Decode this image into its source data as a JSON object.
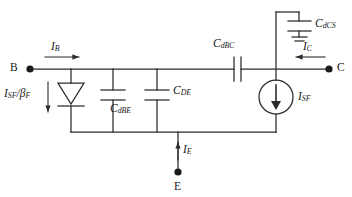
{
  "diagram": {
    "stroke_color": "#2b2b2b",
    "text_color": "#1a1a1a",
    "background": "#ffffff"
  },
  "terminals": [
    {
      "id": "base",
      "label": "B"
    },
    {
      "id": "collector",
      "label": "C"
    },
    {
      "id": "emitter",
      "label": "E"
    }
  ],
  "currents": [
    {
      "id": "base-current",
      "symbol": "I",
      "subscript": "B",
      "direction": "right"
    },
    {
      "id": "collector-current",
      "symbol": "I",
      "subscript": "C",
      "direction": "left"
    },
    {
      "id": "emitter-current",
      "symbol": "I",
      "subscript": "E",
      "direction": "up"
    },
    {
      "id": "diode-current",
      "symbol": "I",
      "subscript": "SF",
      "denominator_symbol": "β",
      "denominator_subscript": "F",
      "direction": "down"
    },
    {
      "id": "source-current",
      "symbol": "I",
      "subscript": "SF",
      "direction": "down"
    }
  ],
  "components": [
    {
      "id": "diode-base-emitter",
      "type": "diode",
      "label_symbol": "I",
      "label_subscript": "SF",
      "label_divider": "/",
      "label_denominator": "β",
      "label_denominator_subscript": "F"
    },
    {
      "id": "cap-dbe",
      "type": "capacitor",
      "symbol": "C",
      "subscript": "dBE"
    },
    {
      "id": "cap-de",
      "type": "capacitor",
      "symbol": "C",
      "subscript": "DE"
    },
    {
      "id": "cap-dbc",
      "type": "capacitor",
      "symbol": "C",
      "subscript": "dBC"
    },
    {
      "id": "cap-dcs",
      "type": "capacitor",
      "symbol": "C",
      "subscript": "dCS"
    },
    {
      "id": "current-source-sf",
      "type": "current-source",
      "symbol": "I",
      "subscript": "SF"
    },
    {
      "id": "ground-substrate",
      "type": "ground"
    }
  ],
  "labels": {
    "terminal_b": "B",
    "terminal_c": "C",
    "terminal_e": "E",
    "i_b_sym": "I",
    "i_b_sub": "B",
    "i_c_sym": "I",
    "i_c_sub": "C",
    "i_e_sym": "I",
    "i_e_sub": "E",
    "i_sf_beta_f_num_sym": "I",
    "i_sf_beta_f_num_sub": "SF",
    "i_sf_beta_f_slash": "/",
    "i_sf_beta_f_den_sym": "β",
    "i_sf_beta_f_den_sub": "F",
    "c_dbe_sym": "C",
    "c_dbe_sub": "dBE",
    "c_de_sym": "C",
    "c_de_sub": "DE",
    "c_dbc_sym": "C",
    "c_dbc_sub": "dBC",
    "c_dcs_sym": "C",
    "c_dcs_sub": "dCS",
    "i_sf_sym": "I",
    "i_sf_sub": "SF"
  }
}
